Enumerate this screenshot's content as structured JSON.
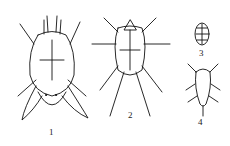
{
  "figure": {
    "type": "scientific-line-drawing",
    "panels": [
      {
        "id": 1,
        "label": "1",
        "description": "large mite, dorsal view, with broad posterior lobes"
      },
      {
        "id": 2,
        "label": "2",
        "description": "mite with long spread legs and long posterior setae"
      },
      {
        "id": 3,
        "label": "3",
        "description": "oval egg with reticulate pattern"
      },
      {
        "id": 4,
        "label": "4",
        "description": "small larva/nymph"
      }
    ]
  }
}
